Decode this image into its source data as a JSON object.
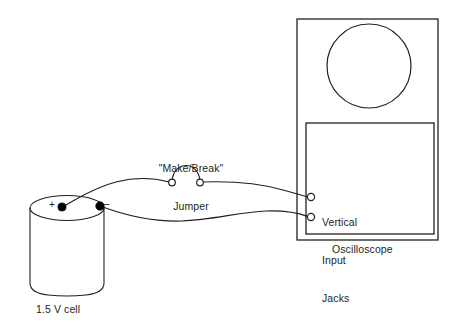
{
  "diagram": {
    "background_color": "#ffffff",
    "ink_color": "#231f20",
    "labels": {
      "cell": "1.5 V cell",
      "jumper_line1": "\"Make/Break\"",
      "jumper_line2": "Jumper",
      "jacks": "Vertical\nInput\nJacks",
      "jacks_line1": "Vertical",
      "jacks_line2": "Input",
      "jacks_line3": "Jacks",
      "oscilloscope": "Oscilloscope",
      "terminal_positive": "+",
      "terminal_negative": "–"
    },
    "components": {
      "cell": {
        "name": "1.5 V cell",
        "shape": "cylinder",
        "top_ellipse_cx": 67,
        "top_ellipse_cy": 208,
        "top_ellipse_rx": 37,
        "top_ellipse_ry": 12,
        "body_bottom_y": 292,
        "terminals": [
          {
            "name": "positive",
            "sign": "+",
            "x": 62,
            "y": 207
          },
          {
            "name": "negative",
            "sign": "–",
            "x": 100,
            "y": 206
          }
        ]
      },
      "jumper": {
        "name": "Make/Break Jumper",
        "left_contact": {
          "x": 172,
          "y": 182
        },
        "right_contact": {
          "x": 200,
          "y": 182
        },
        "arc_peak_y": 170
      },
      "oscilloscope": {
        "name": "Oscilloscope",
        "outer_box": {
          "x": 297,
          "y": 19,
          "width": 141,
          "height": 221
        },
        "inner_panel": {
          "x": 306,
          "y": 123,
          "width": 128,
          "height": 111
        },
        "crt_screen": {
          "cx": 369,
          "cy": 66,
          "r": 42
        },
        "jacks": [
          {
            "name": "vertical-input-jack-top",
            "x": 311,
            "y": 197,
            "r": 3.6
          },
          {
            "name": "vertical-input-jack-bottom",
            "x": 311,
            "y": 217,
            "r": 3.6
          }
        ]
      }
    },
    "wires": [
      {
        "name": "wire-positive-to-jumper",
        "from": "cell positive terminal",
        "to": "jumper left contact"
      },
      {
        "name": "wire-jumper-to-top-jack",
        "from": "jumper right contact",
        "to": "oscilloscope top vertical input jack"
      },
      {
        "name": "wire-negative-to-bottom-jack",
        "from": "cell negative terminal",
        "to": "oscilloscope bottom vertical input jack"
      }
    ]
  }
}
